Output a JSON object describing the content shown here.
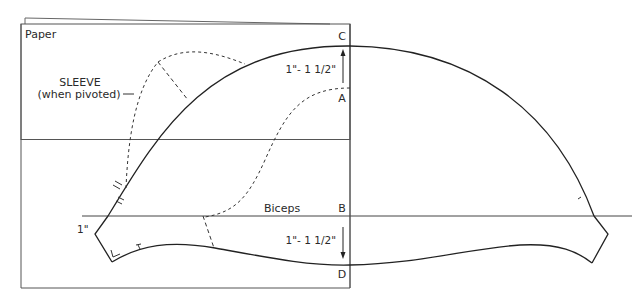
{
  "diagram": {
    "paper_label": "Paper",
    "sleeve_label_line1": "SLEEVE",
    "sleeve_label_line2": "(when pivoted)",
    "biceps_label": "Biceps",
    "points": {
      "A": "A",
      "B": "B",
      "C": "C",
      "D": "D"
    },
    "measurements": {
      "cap_extension": "1\"- 1 1/2\"",
      "hem_extension": "1\"- 1 1/2\"",
      "side_offset": "1\""
    },
    "colors": {
      "line": "#2a2a2a",
      "paper_edge": "#555555",
      "background": "#ffffff"
    }
  }
}
